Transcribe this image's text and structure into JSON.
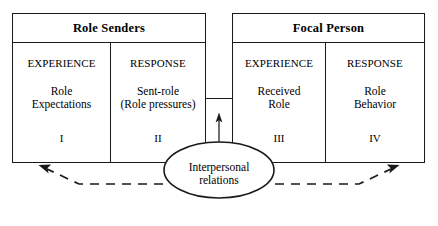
{
  "diagram": {
    "type": "role-episode-diagram",
    "colors": {
      "stroke": "#1a1a1a",
      "text": "#000000",
      "background": "#ffffff"
    },
    "boxes": [
      {
        "id": "role-senders",
        "header": "Role Senders",
        "cells": [
          {
            "caption": "EXPERIENCE",
            "line1": "Role",
            "line2": "Expectations",
            "numeral": "I"
          },
          {
            "caption": "RESPONSE",
            "line1": "Sent-role",
            "line2": "(Role pressures)",
            "numeral": "II"
          }
        ]
      },
      {
        "id": "focal-person",
        "header": "Focal Person",
        "cells": [
          {
            "caption": "EXPERIENCE",
            "line1": "Received",
            "line2": "Role",
            "numeral": "III"
          },
          {
            "caption": "RESPONSE",
            "line1": "Role",
            "line2": "Behavior",
            "numeral": "IV"
          }
        ]
      }
    ],
    "ellipse": {
      "line1": "Interpersonal",
      "line2": "relations"
    },
    "connectors": [
      {
        "name": "sent-role-to-received-role-arrow",
        "style": "solid",
        "direction": "up"
      },
      {
        "name": "feedback-arrow-left",
        "style": "dashed",
        "direction": "up-left"
      },
      {
        "name": "feedback-arrow-right",
        "style": "dashed",
        "direction": "up-right"
      }
    ]
  }
}
